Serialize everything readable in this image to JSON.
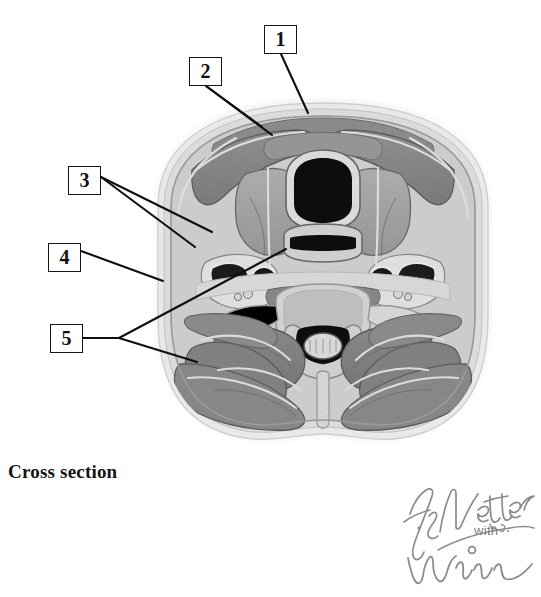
{
  "page": {
    "width": 541,
    "height": 597,
    "background": "#ffffff"
  },
  "caption": {
    "text": "Cross section",
    "x": 8,
    "y": 461
  },
  "callouts": [
    {
      "id": 1,
      "label": "1",
      "box": {
        "x": 264,
        "y": 25,
        "w": 33,
        "h": 29
      },
      "leaders": [
        {
          "points": "281,54 308,113"
        }
      ]
    },
    {
      "id": 2,
      "label": "2",
      "box": {
        "x": 189,
        "y": 57,
        "w": 33,
        "h": 29
      },
      "leaders": [
        {
          "points": "206,86 262,127"
        },
        {
          "points": "206,86 272,135"
        }
      ]
    },
    {
      "id": 3,
      "label": "3",
      "box": {
        "x": 68,
        "y": 166,
        "w": 33,
        "h": 29
      },
      "leaders": [
        {
          "points": "101,177 212,232"
        },
        {
          "points": "101,177 195,247"
        }
      ]
    },
    {
      "id": 4,
      "label": "4",
      "box": {
        "x": 48,
        "y": 243,
        "w": 33,
        "h": 29
      },
      "leaders": [
        {
          "points": "81,251 163,281"
        }
      ]
    },
    {
      "id": 5,
      "label": "5",
      "box": {
        "x": 50,
        "y": 324,
        "w": 33,
        "h": 29
      },
      "leaders": [
        {
          "points": "83,338 119,338 286,249"
        },
        {
          "points": "119,338 197,362"
        }
      ]
    }
  ],
  "signature": {
    "artist": "F. Netter M.D.",
    "conjunction": "with",
    "collaborator": "Winn",
    "color": "#8b8b91"
  },
  "figure": {
    "kind": "axial-mri-neck-cross-section",
    "bounds": {
      "x": 118,
      "y": 78,
      "w": 410,
      "h": 375
    },
    "palette": {
      "skin_outer": "#ededed",
      "subcutaneous_fat": "#dcdcdc",
      "fascia": "#cfcfcf",
      "muscle": "#8a8a8a",
      "muscle_dark": "#777777",
      "gland": "#a8a8a8",
      "bone_cortex": "#e6e6e6",
      "bone_marrow": "#c9c9c9",
      "airway": "#0d0d0d",
      "vessel_dark": "#2a2a2a",
      "cord": "#dadada",
      "outline": "#4a4a4a"
    },
    "structures": [
      "skin and subcutaneous tissue",
      "sternocleidomastoid muscle",
      "thyroid gland",
      "trachea / airway lumen",
      "esophagus",
      "carotid artery and internal jugular vein",
      "cervical vertebral body",
      "spinal cord in vertebral canal",
      "posterior cervical paraspinal muscles",
      "trapezius muscle",
      "nuchal ligament / midline septum"
    ]
  }
}
